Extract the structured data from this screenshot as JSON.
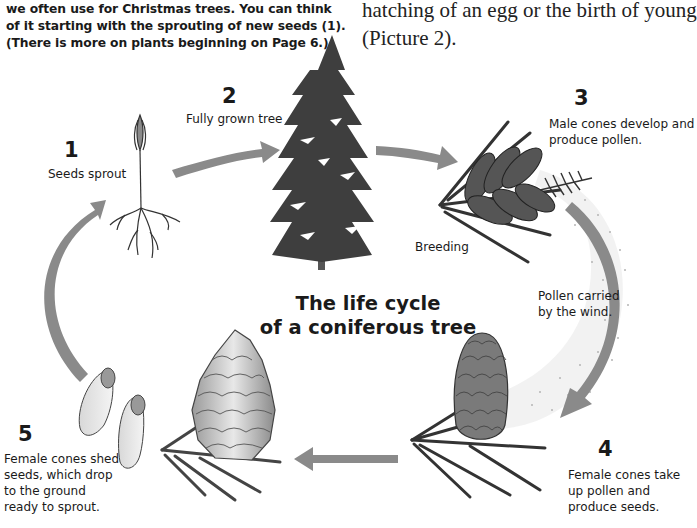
{
  "intro": {
    "left_text": "we often use for Christmas trees. You can think\nof it starting with the sprouting of new seeds (1).\n(There is more on plants beginning on Page 6.)",
    "right_text": "hatching of an egg or the birth of young\n(Picture 2)."
  },
  "diagram": {
    "title": "The life cycle\nof a coniferous tree",
    "arrow_color": "#8a8a8a",
    "stages": [
      {
        "number": "1",
        "label": "Seeds sprout",
        "illustration": "seedling-icon"
      },
      {
        "number": "2",
        "label": "Fully grown tree",
        "illustration": "conifer-tree-icon"
      },
      {
        "number": "3",
        "label": "Male cones develop and\nproduce pollen.",
        "illustration": "male-cones-icon"
      },
      {
        "number": "4",
        "label": "Female cones take\nup pollen and\nproduce seeds.",
        "illustration": "female-cone-icon"
      },
      {
        "number": "5",
        "label": "Female cones shed\nseeds, which drop\nto the ground\nready to sprout.",
        "illustration": "open-pine-cone-icon"
      }
    ],
    "annotations": {
      "breeding": "Breeding",
      "pollen": "Pollen carried\nby the wind."
    }
  }
}
